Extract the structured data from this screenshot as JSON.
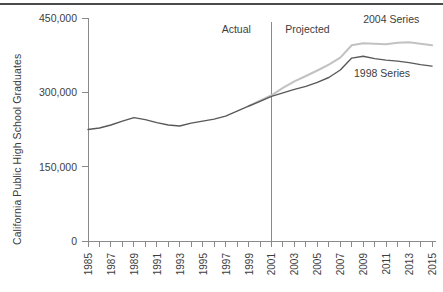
{
  "chart_data": {
    "type": "line",
    "title": "",
    "xlabel": "",
    "ylabel": "California Public High School Graduates",
    "ylim": [
      0,
      450000
    ],
    "xlim": [
      1985,
      2015
    ],
    "yticks": [
      0,
      150000,
      300000,
      450000
    ],
    "ytick_labels": [
      "0",
      "150,000",
      "300,000",
      "450,000"
    ],
    "xticks": [
      1985,
      1986,
      1987,
      1988,
      1989,
      1990,
      1991,
      1992,
      1993,
      1994,
      1995,
      1996,
      1997,
      1998,
      1999,
      2000,
      2001,
      2002,
      2003,
      2004,
      2005,
      2006,
      2007,
      2008,
      2009,
      2010,
      2011,
      2012,
      2013,
      2014,
      2015
    ],
    "xtick_labels": [
      "1985",
      "",
      "1987",
      "",
      "1989",
      "",
      "1991",
      "",
      "1993",
      "",
      "1995",
      "",
      "1997",
      "",
      "1999",
      "",
      "2001",
      "",
      "2003",
      "",
      "2005",
      "",
      "2007",
      "",
      "2009",
      "",
      "2011",
      "",
      "2013",
      "",
      "2015"
    ],
    "grid": false,
    "legend_position": "inline-annotations",
    "series": [
      {
        "name": "1998 Series",
        "color": "#595959",
        "x": [
          1985,
          1986,
          1987,
          1988,
          1989,
          1990,
          1991,
          1992,
          1993,
          1994,
          1995,
          1996,
          1997,
          1998,
          1999,
          2000,
          2001,
          2002,
          2003,
          2004,
          2005,
          2006,
          2007,
          2008,
          2009,
          2010,
          2011,
          2012,
          2013,
          2014,
          2015
        ],
        "values": [
          225000,
          228000,
          234000,
          242000,
          249000,
          245000,
          239000,
          234000,
          232000,
          238000,
          242000,
          246000,
          252000,
          262000,
          272000,
          282000,
          292000,
          299000,
          306000,
          312000,
          320000,
          330000,
          345000,
          369000,
          373000,
          368000,
          365000,
          363000,
          360000,
          356000,
          353000
        ]
      },
      {
        "name": "2004 Series",
        "color": "#c2c2c2",
        "x": [
          1999,
          2000,
          2001,
          2002,
          2003,
          2004,
          2005,
          2006,
          2007,
          2008,
          2009,
          2010,
          2011,
          2012,
          2013,
          2014,
          2015
        ],
        "values": [
          272000,
          283000,
          294000,
          309000,
          322000,
          333000,
          344000,
          356000,
          370000,
          395000,
          399000,
          398000,
          397000,
          400000,
          401000,
          398000,
          395000
        ]
      }
    ],
    "annotations": [
      {
        "text": "Actual",
        "x_value": 1999.2,
        "y_value": 420000
      },
      {
        "text": "Projected",
        "x_value": 2002.2,
        "y_value": 420000
      },
      {
        "text": "2004 Series",
        "x_value": 2009.0,
        "y_value": 440000
      },
      {
        "text": "1998 Series",
        "x_value": 2008.2,
        "y_value": 330000
      }
    ],
    "divider": {
      "x_value": 2001,
      "label_left": "Actual",
      "label_right": "Projected"
    }
  }
}
